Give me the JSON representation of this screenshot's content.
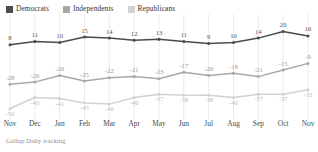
{
  "legend": {
    "items": [
      {
        "label": "Democrats",
        "color": "#4b4b4b",
        "key": "democrats"
      },
      {
        "label": "Independents",
        "color": "#a8a8a8",
        "key": "independents"
      },
      {
        "label": "Republicans",
        "color": "#d2d2d2",
        "key": "republicans"
      }
    ]
  },
  "footer": {
    "source": "Gallup Daily tracking"
  },
  "chart_data": {
    "type": "line",
    "title": "",
    "subtitle": "",
    "xlabel": "",
    "ylabel": "",
    "source": "Gallup Daily tracking",
    "grid": true,
    "grid_axis": "x",
    "legend_position": "top-left",
    "ylim": [
      -55,
      25
    ],
    "categories": [
      "Nov",
      "Dec",
      "Jan",
      "Feb",
      "Mar",
      "Apr",
      "May",
      "Jun",
      "Jul",
      "Aug",
      "Sep",
      "Oct",
      "Nov"
    ],
    "series": [
      {
        "name": "Democrats",
        "color": "#4b4b4b",
        "values": [
          8,
          11,
          10,
          15,
          14,
          12,
          13,
          11,
          9,
          10,
          14,
          20,
          16
        ]
      },
      {
        "name": "Independents",
        "color": "#a8a8a8",
        "values": [
          -28,
          -26,
          -20,
          -25,
          -22,
          -21,
          -23,
          -17,
          -20,
          -18,
          -21,
          -15,
          -9
        ]
      },
      {
        "name": "Republicans",
        "color": "#d2d2d2",
        "values": [
          -50,
          -40,
          -41,
          -45,
          -46,
          -40,
          -37,
          -38,
          -38,
          -40,
          -37,
          -37,
          -33
        ]
      }
    ]
  }
}
